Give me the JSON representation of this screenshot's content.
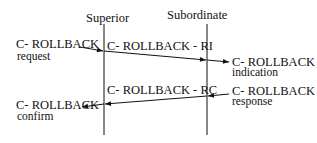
{
  "diagram": {
    "type": "sequence",
    "participants": [
      {
        "id": "superior",
        "label": "Superior"
      },
      {
        "id": "subordinate",
        "label": "Subordinate"
      }
    ],
    "messages": [
      {
        "id": "ri",
        "from": "superior",
        "to": "subordinate",
        "label": "C- ROLLBACK - RI"
      },
      {
        "id": "rc",
        "from": "subordinate",
        "to": "superior",
        "label": "C- ROLLBACK - RC"
      }
    ],
    "primitives": [
      {
        "id": "request",
        "side": "superior",
        "direction": "in",
        "line1": "C- ROLLBACK",
        "line2": "request"
      },
      {
        "id": "indication",
        "side": "subordinate",
        "direction": "out",
        "line1": "C- ROLLBACK",
        "line2": "indication"
      },
      {
        "id": "response",
        "side": "subordinate",
        "direction": "in",
        "line1": "C- ROLLBACK",
        "line2": "response"
      },
      {
        "id": "confirm",
        "side": "superior",
        "direction": "out",
        "line1": "C- ROLLBACK",
        "line2": "confirm"
      }
    ]
  }
}
